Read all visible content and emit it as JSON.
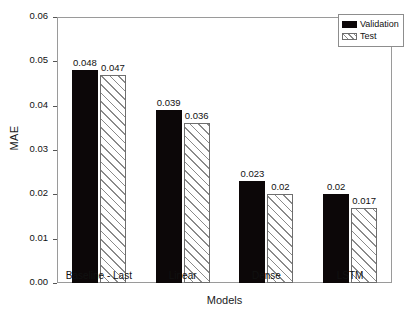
{
  "chart_data": {
    "type": "bar",
    "title": "",
    "xlabel": "Models",
    "ylabel": "MAE",
    "categories": [
      "Baseline - Last",
      "Linear",
      "Dense",
      "LSTM"
    ],
    "series": [
      {
        "name": "Validation",
        "values": [
          0.048,
          0.039,
          0.023,
          0.02
        ],
        "labels": [
          "0.048",
          "0.039",
          "0.023",
          "0.02"
        ],
        "color": "#0c0708",
        "fill": "solid"
      },
      {
        "name": "Test",
        "values": [
          0.047,
          0.036,
          0.02,
          0.017
        ],
        "labels": [
          "0.047",
          "0.036",
          "0.02",
          "0.017"
        ],
        "color": "#ffffff",
        "fill": "diagonal-hatch"
      }
    ],
    "ylim": [
      0.0,
      0.06
    ],
    "yticks": [
      "0.00",
      "0.01",
      "0.02",
      "0.03",
      "0.04",
      "0.05",
      "0.06"
    ],
    "ytick_values": [
      0.0,
      0.01,
      0.02,
      0.03,
      0.04,
      0.05,
      0.06
    ],
    "grid": false,
    "legend_position": "top-right",
    "frame_color": "#9a9a9a",
    "background": "#ffffff"
  }
}
